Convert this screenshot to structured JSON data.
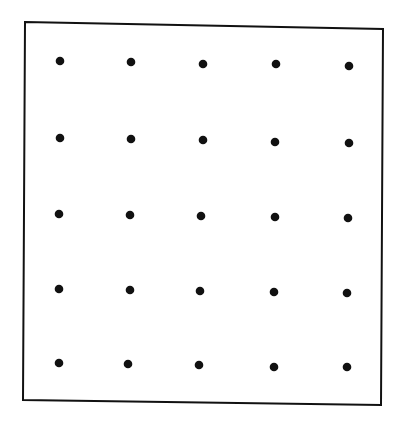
{
  "diagram": {
    "type": "dot-grid",
    "rows": 5,
    "columns": 5,
    "background_color": "#ffffff",
    "stroke_color": "#111111",
    "dot_color": "#111111",
    "frame": {
      "corners": [
        [
          25,
          22
        ],
        [
          383,
          29
        ],
        [
          381,
          405
        ],
        [
          23,
          400
        ]
      ],
      "stroke_width": 2
    },
    "dot_radius": 4.3,
    "dots": [
      [
        [
          60,
          61
        ],
        [
          131,
          62
        ],
        [
          203,
          64
        ],
        [
          276,
          64
        ],
        [
          349,
          66
        ]
      ],
      [
        [
          60,
          138
        ],
        [
          131,
          139
        ],
        [
          203,
          140
        ],
        [
          275,
          142
        ],
        [
          349,
          143
        ]
      ],
      [
        [
          59,
          214
        ],
        [
          130,
          215
        ],
        [
          201,
          216
        ],
        [
          275,
          217
        ],
        [
          348,
          218
        ]
      ],
      [
        [
          59,
          289
        ],
        [
          130,
          290
        ],
        [
          200,
          291
        ],
        [
          274,
          292
        ],
        [
          347,
          293
        ]
      ],
      [
        [
          59,
          363
        ],
        [
          128,
          364
        ],
        [
          199,
          365
        ],
        [
          274,
          367
        ],
        [
          347,
          367
        ]
      ]
    ]
  }
}
